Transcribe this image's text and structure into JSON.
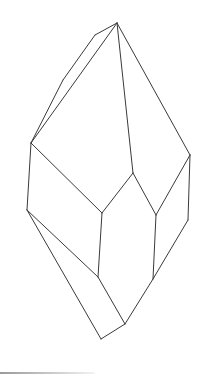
{
  "figure": {
    "stroke_color": "#3a3a3a",
    "background": "#ffffff",
    "vertices": {
      "apex": [
        117,
        23
      ],
      "ul1": [
        95,
        35
      ],
      "ul2": [
        63,
        80
      ],
      "left": [
        31,
        143
      ],
      "right": [
        190,
        155
      ],
      "center_top": [
        133,
        173
      ],
      "inner_left": [
        102,
        213
      ],
      "inner_right": [
        156,
        215
      ],
      "left_low": [
        27,
        210
      ],
      "right_low": [
        188,
        220
      ],
      "inner_left_low": [
        98,
        277
      ],
      "inner_right_low": [
        153,
        279
      ],
      "bottom_mid": [
        125,
        324
      ],
      "bottom": [
        101,
        339
      ]
    },
    "edges": [
      [
        "apex",
        "ul1"
      ],
      [
        "ul1",
        "ul2"
      ],
      [
        "ul2",
        "left"
      ],
      [
        "apex",
        "left"
      ],
      [
        "apex",
        "center_top"
      ],
      [
        "apex",
        "right"
      ],
      [
        "left",
        "inner_left"
      ],
      [
        "center_top",
        "inner_left"
      ],
      [
        "center_top",
        "inner_right"
      ],
      [
        "right",
        "inner_right"
      ],
      [
        "left",
        "left_low"
      ],
      [
        "right",
        "right_low"
      ],
      [
        "inner_left",
        "inner_left_low"
      ],
      [
        "inner_right",
        "inner_right_low"
      ],
      [
        "left_low",
        "inner_left_low"
      ],
      [
        "right_low",
        "inner_right_low"
      ],
      [
        "left_low",
        "bottom"
      ],
      [
        "inner_left_low",
        "bottom_mid"
      ],
      [
        "inner_right_low",
        "bottom_mid"
      ],
      [
        "bottom_mid",
        "bottom"
      ]
    ]
  }
}
